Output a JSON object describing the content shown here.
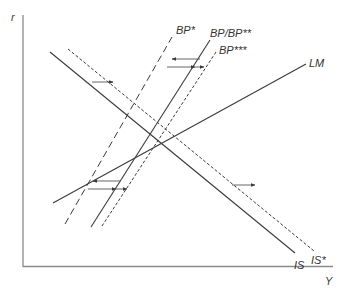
{
  "diagram": {
    "type": "IS-LM-BP economic diagram",
    "axes": {
      "y_label": "r",
      "x_label": "Y",
      "color": "#8a8a8a"
    },
    "curves": [
      {
        "id": "IS",
        "label": "IS",
        "style": "solid"
      },
      {
        "id": "IS_star",
        "label": "IS*",
        "style": "short-dash"
      },
      {
        "id": "LM",
        "label": "LM",
        "style": "solid"
      },
      {
        "id": "BP_star",
        "label": "BP*",
        "style": "long-dash"
      },
      {
        "id": "BP",
        "label": "BP/BP**",
        "style": "solid"
      },
      {
        "id": "BP_3star",
        "label": "BP***",
        "style": "short-dash"
      }
    ],
    "shift_arrows": [
      {
        "from": "IS",
        "to": "IS*",
        "direction": "right",
        "position": "upper"
      },
      {
        "from": "IS",
        "to": "IS*",
        "direction": "right",
        "position": "lower"
      },
      {
        "from": "BP",
        "to": "BP*",
        "direction": "left",
        "position": "upper"
      },
      {
        "from": "BP*",
        "to": "BP***",
        "direction": "right",
        "position": "upper"
      },
      {
        "from": "BP",
        "to": "BP*",
        "direction": "left",
        "position": "lower"
      },
      {
        "from": "BP*",
        "to": "BP***",
        "direction": "right",
        "position": "lower"
      }
    ],
    "line_color": "#3a3a3a"
  }
}
